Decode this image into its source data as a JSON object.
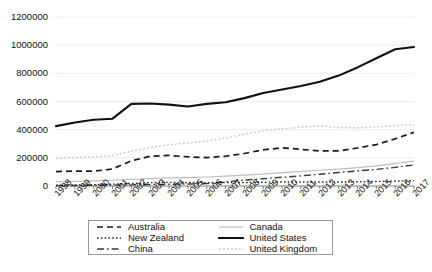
{
  "chart_data": {
    "type": "line",
    "title": "",
    "xlabel": "",
    "ylabel": "",
    "ylim": [
      0,
      1200000
    ],
    "ytick_step": 200000,
    "ytick_labels": [
      "1200000",
      "1000000",
      "800000",
      "600000",
      "400000",
      "200000",
      "0"
    ],
    "grid": true,
    "legend_position": "bottom",
    "x": [
      1998,
      1999,
      2000,
      2001,
      2002,
      2003,
      2004,
      2005,
      2006,
      2007,
      2008,
      2009,
      2010,
      2011,
      2012,
      2013,
      2014,
      2015,
      2016,
      2017
    ],
    "xtick_labels": [
      "1998",
      "1999",
      "2000",
      "2001",
      "2002",
      "2003",
      "2004",
      "2005",
      "2006",
      "2007",
      "2008",
      "2009",
      "2010",
      "2011",
      "2012",
      "2013",
      "2014",
      "2015",
      "2016",
      "2017"
    ],
    "series": [
      {
        "name": "Australia",
        "style": "dashed",
        "color": "#1a1a1a",
        "values": [
          102000,
          106000,
          105000,
          121000,
          179000,
          211000,
          217000,
          207000,
          202000,
          211000,
          231000,
          257000,
          271000,
          260000,
          249000,
          249000,
          270000,
          294000,
          335000,
          381000
        ]
      },
      {
        "name": "Canada",
        "style": "solid-light",
        "color": "#bdbdbd",
        "values": [
          29000,
          32000,
          36000,
          41000,
          47000,
          53000,
          57000,
          60000,
          64000,
          70000,
          77000,
          85000,
          95000,
          104000,
          112000,
          120000,
          131000,
          143000,
          160000,
          177000
        ]
      },
      {
        "name": "China",
        "style": "dash-dot",
        "color": "#3a3a3a",
        "values": [
          3000,
          4000,
          5000,
          6000,
          8000,
          10000,
          12000,
          14000,
          17000,
          29000,
          42000,
          52000,
          62000,
          72000,
          83000,
          96000,
          107000,
          118000,
          132000,
          150000
        ]
      },
      {
        "name": "New Zealand",
        "style": "dotted",
        "color": "#2b2b2b",
        "values": [
          5000,
          7000,
          9000,
          13000,
          18000,
          24000,
          26000,
          25000,
          24000,
          24000,
          25000,
          27000,
          28000,
          28000,
          28000,
          28000,
          30000,
          32000,
          35000,
          38000
        ]
      },
      {
        "name": "United States",
        "style": "solid-thick",
        "color": "#111111",
        "values": [
          425000,
          451000,
          470000,
          478000,
          583000,
          586000,
          578000,
          565000,
          583000,
          595000,
          624000,
          661000,
          685000,
          710000,
          740000,
          784000,
          842000,
          907000,
          971000,
          987000
        ]
      },
      {
        "name": "United Kingdom",
        "style": "dotted-light",
        "color": "#c9c9c9",
        "values": [
          198000,
          202000,
          206000,
          217000,
          247000,
          272000,
          293000,
          306000,
          319000,
          340000,
          368000,
          392000,
          406000,
          419000,
          427000,
          416000,
          414000,
          419000,
          428000,
          436000
        ]
      }
    ]
  },
  "legend": {
    "items": [
      {
        "label": "Australia",
        "style": "dashed"
      },
      {
        "label": "Canada",
        "style": "solid-light"
      },
      {
        "label": "New Zealand",
        "style": "dotted"
      },
      {
        "label": "United States",
        "style": "solid-thick"
      },
      {
        "label": "China",
        "style": "dash-dot"
      },
      {
        "label": "United Kingdom",
        "style": "dotted-light"
      }
    ]
  },
  "caption": {
    "cropped_text": ""
  }
}
